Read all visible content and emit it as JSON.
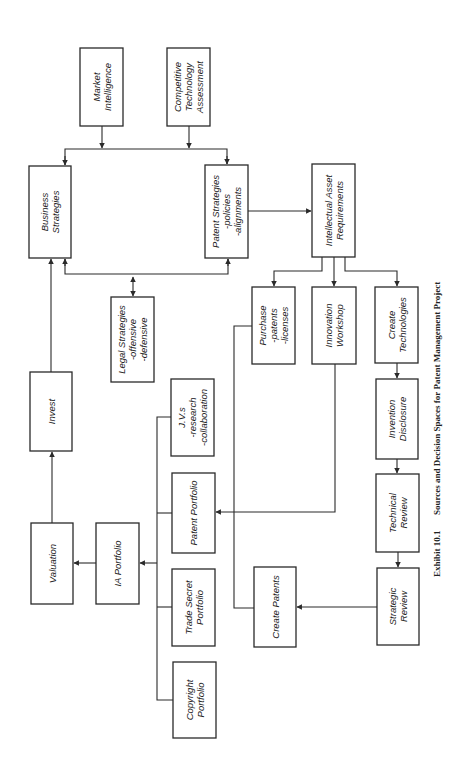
{
  "diagram": {
    "orientation": "rotated-90-ccw",
    "caption": {
      "number": "Exhibit 10.1",
      "title": "Sources and Decision Spaces for Patent Management Project"
    },
    "nodes": [
      {
        "id": "market",
        "lines": [
          "Market",
          "Intelligence"
        ],
        "x": 80,
        "y": 48,
        "w": 43,
        "h": 78
      },
      {
        "id": "competitive",
        "lines": [
          "Competitive",
          "Technology",
          "Assessment"
        ],
        "x": 167,
        "y": 48,
        "w": 43,
        "h": 78
      },
      {
        "id": "business",
        "lines": [
          "Business",
          "Strategies"
        ],
        "x": 29,
        "y": 166,
        "w": 42,
        "h": 92
      },
      {
        "id": "patent_strat",
        "lines": [
          "Patent Strategies",
          "-policies",
          "-alignments"
        ],
        "x": 205,
        "y": 165,
        "w": 43,
        "h": 93
      },
      {
        "id": "ia_req",
        "lines": [
          "Intellectual Asset",
          "Requirements"
        ],
        "x": 312,
        "y": 164,
        "w": 43,
        "h": 93
      },
      {
        "id": "legal",
        "lines": [
          "Legal Strategies",
          "-offensive",
          "-defensive"
        ],
        "x": 111,
        "y": 297,
        "w": 43,
        "h": 85
      },
      {
        "id": "purchase",
        "lines": [
          "Purchase",
          "-patents",
          "-licenses"
        ],
        "x": 252,
        "y": 287,
        "w": 43,
        "h": 77
      },
      {
        "id": "innovation",
        "lines": [
          "Innovation",
          "Workshop"
        ],
        "x": 312,
        "y": 287,
        "w": 44,
        "h": 77
      },
      {
        "id": "create_tech",
        "lines": [
          "Create",
          "Technologies"
        ],
        "x": 375,
        "y": 287,
        "w": 43,
        "h": 76
      },
      {
        "id": "invest",
        "lines": [
          "Invest"
        ],
        "x": 30,
        "y": 372,
        "w": 42,
        "h": 79
      },
      {
        "id": "jvs",
        "lines": [
          "J.V.s",
          "-research",
          "-collaboration"
        ],
        "x": 171,
        "y": 379,
        "w": 43,
        "h": 77
      },
      {
        "id": "invention",
        "lines": [
          "Invention",
          "Disclosure"
        ],
        "x": 376,
        "y": 379,
        "w": 42,
        "h": 80
      },
      {
        "id": "patent_port",
        "lines": [
          "Patent Portfolio"
        ],
        "x": 172,
        "y": 473,
        "w": 43,
        "h": 80
      },
      {
        "id": "technical",
        "lines": [
          "Technical",
          "Review"
        ],
        "x": 376,
        "y": 474,
        "w": 43,
        "h": 78
      },
      {
        "id": "valuation",
        "lines": [
          "Valuation"
        ],
        "x": 31,
        "y": 523,
        "w": 42,
        "h": 81
      },
      {
        "id": "ia_port",
        "lines": [
          "IA Portfolio"
        ],
        "x": 96,
        "y": 523,
        "w": 43,
        "h": 81
      },
      {
        "id": "trade_secret",
        "lines": [
          "Trade Secret",
          "Portfolio"
        ],
        "x": 172,
        "y": 569,
        "w": 43,
        "h": 77
      },
      {
        "id": "create_patents",
        "lines": [
          "Create Patents"
        ],
        "x": 254,
        "y": 567,
        "w": 42,
        "h": 80
      },
      {
        "id": "strategic",
        "lines": [
          "Strategic",
          "Review"
        ],
        "x": 377,
        "y": 568,
        "w": 42,
        "h": 77
      },
      {
        "id": "copyright",
        "lines": [
          "Copyright",
          "Portfolio"
        ],
        "x": 173,
        "y": 662,
        "w": 43,
        "h": 76
      }
    ],
    "edges": [
      {
        "from": "market",
        "to": "business"
      },
      {
        "from": "market",
        "to": "patent_strat"
      },
      {
        "from": "competitive",
        "to": "business"
      },
      {
        "from": "competitive",
        "to": "patent_strat"
      },
      {
        "from": "patent_strat",
        "to": "ia_req"
      },
      {
        "from": "legal",
        "to": "business",
        "bidirectional": true
      },
      {
        "from": "legal",
        "to": "patent_strat"
      },
      {
        "from": "ia_req",
        "to": "purchase"
      },
      {
        "from": "ia_req",
        "to": "innovation"
      },
      {
        "from": "ia_req",
        "to": "create_tech"
      },
      {
        "from": "create_tech",
        "to": "invention"
      },
      {
        "from": "invention",
        "to": "technical"
      },
      {
        "from": "technical",
        "to": "strategic"
      },
      {
        "from": "strategic",
        "to": "create_patents"
      },
      {
        "from": "innovation",
        "to": "patent_port"
      },
      {
        "from": "purchase",
        "to": "create_patents"
      },
      {
        "from": "jvs",
        "to": "ia_port"
      },
      {
        "from": "patent_port",
        "to": "ia_port"
      },
      {
        "from": "trade_secret",
        "to": "ia_port"
      },
      {
        "from": "copyright",
        "to": "ia_port"
      },
      {
        "from": "ia_port",
        "to": "valuation"
      },
      {
        "from": "valuation",
        "to": "invest"
      },
      {
        "from": "invest",
        "to": "business"
      }
    ]
  }
}
